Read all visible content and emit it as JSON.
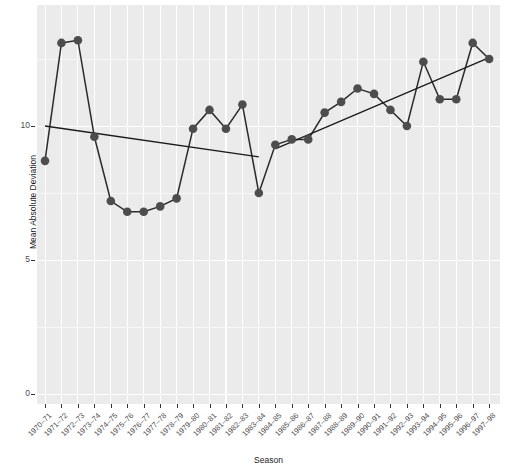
{
  "chart_data": {
    "type": "line",
    "title": "",
    "xlabel": "Season",
    "ylabel": "Mean Absolute Deviation",
    "ylim": [
      0,
      13.9
    ],
    "yticks": [
      0,
      5,
      10
    ],
    "ytick_labels": [
      "0",
      "5",
      "10"
    ],
    "grid": true,
    "legend": "none",
    "marker": "filled-circle",
    "point_color": "#4d4d4d",
    "line_color": "#2b2b2b",
    "trend_color": "#1a1a1a",
    "panel_background": "#ebebeb",
    "gridline_color": "#ffffff",
    "categories": [
      "1970–71",
      "1971–72",
      "1972–73",
      "1973–74",
      "1974–75",
      "1975–76",
      "1976–77",
      "1977–78",
      "1978–79",
      "1979–80",
      "1980–81",
      "1981–82",
      "1982–83",
      "1983–84",
      "1984–85",
      "1985–86",
      "1986–87",
      "1987–88",
      "1988–89",
      "1989–90",
      "1990–91",
      "1991–92",
      "1992–93",
      "1993–94",
      "1994–95",
      "1995–96",
      "1996–97",
      "1997–98"
    ],
    "values": [
      8.7,
      13.1,
      13.2,
      9.6,
      7.2,
      6.8,
      6.8,
      7.0,
      7.3,
      9.9,
      10.6,
      9.9,
      10.8,
      7.5,
      9.3,
      9.5,
      9.5,
      10.5,
      10.9,
      11.4,
      11.2,
      10.6,
      10.0,
      12.4,
      11.0,
      11.0,
      13.1,
      12.5
    ],
    "trend_segments": [
      {
        "name": "trend-1970-71-to-1983-84",
        "x_start": "1970–71",
        "y_start": 10.0,
        "x_end": "1983–84",
        "y_end": 8.85
      },
      {
        "name": "trend-1984-85-to-1997-98",
        "x_start": "1984–85",
        "y_start": 9.15,
        "x_end": "1997–98",
        "y_end": 12.55
      }
    ]
  },
  "axes": {
    "y_title": "Mean Absolute Deviation",
    "x_title": "Season"
  }
}
